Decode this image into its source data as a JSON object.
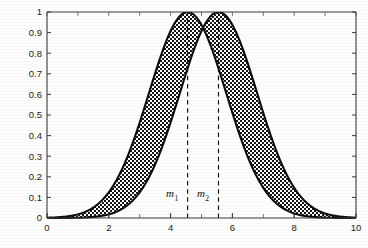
{
  "figure": {
    "title": "",
    "background_color": "#fdfdfb",
    "curve_color": "#0d0d0d",
    "fill_pattern": "stipple-checker",
    "axis_color": "#3a3a3a"
  },
  "axes": {
    "x": {
      "label": "",
      "min": 0,
      "max": 10,
      "tick_labels": [
        "0",
        "2",
        "4",
        "6",
        "8",
        "10"
      ],
      "tick_values": [
        0,
        2,
        4,
        6,
        8,
        10
      ],
      "minor_tick_step": 1
    },
    "y": {
      "label": "",
      "min": 0,
      "max": 1,
      "tick_labels": [
        "0",
        "0.1",
        "0.2",
        "0.3",
        "0.4",
        "0.5",
        "0.6",
        "0.7",
        "0.8",
        "0.9",
        "1"
      ],
      "tick_values": [
        0,
        0.1,
        0.2,
        0.3,
        0.4,
        0.5,
        0.6,
        0.7,
        0.8,
        0.9,
        1
      ]
    }
  },
  "annotations": [
    {
      "name": "m1",
      "text": "m",
      "subscript": "1",
      "x_value": 4.55,
      "label_x_value": 4.05,
      "label_y_value": 0.1,
      "line_style": "dashed"
    },
    {
      "name": "m2",
      "text": "m",
      "subscript": "2",
      "x_value": 5.55,
      "label_x_value": 5.05,
      "label_y_value": 0.1,
      "line_style": "dashed"
    }
  ],
  "chart_data": {
    "type": "line",
    "title": "",
    "xlabel": "",
    "ylabel": "",
    "xlim": [
      0,
      10
    ],
    "ylim": [
      0,
      1
    ],
    "grid": false,
    "legend": null,
    "fill_between": {
      "series": [
        "left-membership-curve",
        "right-membership-curve"
      ],
      "pattern": "dotted-stipple",
      "description": "Region between the two membership curves is stipple-filled"
    },
    "series": [
      {
        "name": "left-membership-curve",
        "peak_x": 4.55,
        "peak_y": 1.0,
        "sigma": 1.25,
        "x": [
          0,
          0.5,
          1.0,
          1.5,
          2.0,
          2.5,
          3.0,
          3.5,
          4.0,
          4.55,
          5.0,
          5.5,
          6.0,
          6.5,
          7.0,
          7.5,
          8.0,
          8.5,
          9.0,
          9.5,
          10.0
        ],
        "values": [
          0.002,
          0.006,
          0.018,
          0.046,
          0.105,
          0.212,
          0.379,
          0.6,
          0.844,
          1.0,
          0.939,
          0.737,
          0.498,
          0.288,
          0.143,
          0.061,
          0.022,
          0.007,
          0.002,
          0.0,
          0.0
        ]
      },
      {
        "name": "right-membership-curve",
        "peak_x": 5.55,
        "peak_y": 1.0,
        "sigma": 1.25,
        "x": [
          0,
          0.5,
          1.0,
          1.5,
          2.0,
          2.5,
          3.0,
          3.5,
          4.0,
          4.55,
          5.0,
          5.5,
          6.0,
          6.5,
          7.0,
          7.5,
          8.0,
          8.5,
          9.0,
          9.5,
          10.0
        ],
        "values": [
          0.0,
          0.001,
          0.002,
          0.007,
          0.022,
          0.061,
          0.143,
          0.288,
          0.498,
          0.763,
          0.918,
          0.999,
          0.937,
          0.737,
          0.498,
          0.288,
          0.143,
          0.061,
          0.022,
          0.007,
          0.002
        ]
      }
    ]
  }
}
